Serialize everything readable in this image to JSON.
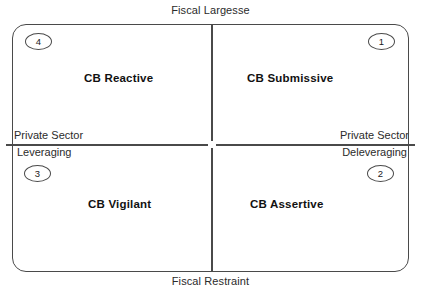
{
  "figure": {
    "name": "Central Bank Policy Quadrant Matrix",
    "line_color": "#4a4a4a",
    "text_color": "#1a1a1a",
    "background": "#ffffff"
  },
  "axes": {
    "vertical": {
      "top_label": "Fiscal Largesse",
      "bottom_label": "Fiscal Restraint"
    },
    "horizontal": {
      "left_label_line1": "Private Sector",
      "left_label_line2": "Leveraging",
      "right_label_line1": "Private Sector",
      "right_label_line2": "Deleveraging"
    }
  },
  "quadrants": [
    {
      "number": "1",
      "label": "CB Submissive",
      "position": "top-right",
      "vertical_axis": "Fiscal Largesse",
      "horizontal_axis": "Private Sector Deleveraging"
    },
    {
      "number": "2",
      "label": "CB Assertive",
      "position": "bottom-right",
      "vertical_axis": "Fiscal Restraint",
      "horizontal_axis": "Private Sector Deleveraging"
    },
    {
      "number": "3",
      "label": "CB Vigilant",
      "position": "bottom-left",
      "vertical_axis": "Fiscal Restraint",
      "horizontal_axis": "Private Sector Leveraging"
    },
    {
      "number": "4",
      "label": "CB Reactive",
      "position": "top-left",
      "vertical_axis": "Fiscal Largesse",
      "horizontal_axis": "Private Sector Leveraging"
    }
  ]
}
